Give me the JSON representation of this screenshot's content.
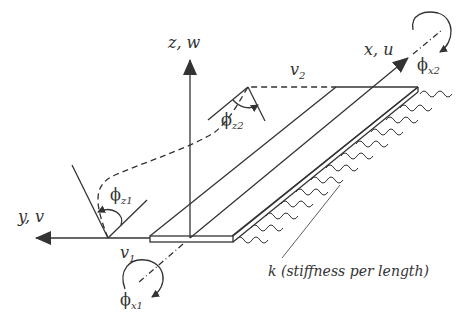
{
  "diagram": {
    "type": "beam on elastic foundation",
    "axes": {
      "x": {
        "label": "x, u"
      },
      "y": {
        "label": "y, v"
      },
      "z": {
        "label": "z, w"
      }
    },
    "displacements": {
      "v1": {
        "symbol": "v",
        "subscript": "1"
      },
      "v2": {
        "symbol": "v",
        "subscript": "2"
      }
    },
    "rotations": {
      "phi_z1": {
        "symbol": "ϕ",
        "subscript": "z1"
      },
      "phi_z2": {
        "symbol": "ϕ",
        "subscript": "z2"
      },
      "phi_x1": {
        "symbol": "ϕ",
        "subscript": "x1"
      },
      "phi_x2": {
        "symbol": "ϕ",
        "subscript": "x2"
      }
    },
    "foundation": {
      "label": "k (stiffness per length)"
    }
  }
}
